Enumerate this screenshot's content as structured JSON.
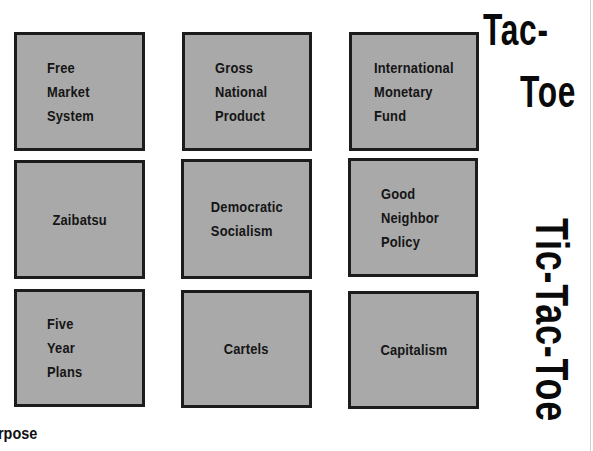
{
  "title": {
    "corner_lines": [
      "Tac-",
      "Toe"
    ],
    "vertical": "Tic-Tac-Toe"
  },
  "grid": {
    "cells": [
      {
        "label": "Free\nMarket\nSystem",
        "align": "left"
      },
      {
        "label": "Gross\nNational\nProduct",
        "align": "left"
      },
      {
        "label": "International\nMonetary\nFund",
        "align": "left"
      },
      {
        "label": "Zaibatsu",
        "align": "center"
      },
      {
        "label": "Democratic\nSocialism",
        "align": "center"
      },
      {
        "label": "Good\nNeighbor\nPolicy",
        "align": "left"
      },
      {
        "label": "Five\nYear\nPlans",
        "align": "left"
      },
      {
        "label": "Cartels",
        "align": "center"
      },
      {
        "label": "Capitalism",
        "align": "center"
      }
    ]
  },
  "footer": {
    "partial_heading": "rpose"
  },
  "colors": {
    "cell_fill": "#a9a9a9",
    "cell_border": "#1c1c1c",
    "text": "#151515",
    "background": "#ffffff"
  }
}
